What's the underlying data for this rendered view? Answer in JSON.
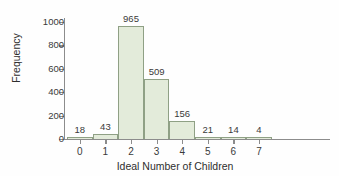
{
  "chart_data": {
    "type": "bar",
    "title": "",
    "subtitle": "",
    "xlabel": "Ideal Number of Children",
    "ylabel": "Frequency",
    "categories": [
      "0",
      "1",
      "2",
      "3",
      "4",
      "5",
      "6",
      "7"
    ],
    "values": [
      18,
      43,
      965,
      509,
      156,
      21,
      14,
      4
    ],
    "data_labels": [
      "18",
      "43",
      "965",
      "509",
      "156",
      "21",
      "14",
      "4"
    ],
    "xlim": [
      -0.5,
      7.5
    ],
    "ylim": [
      0,
      1000
    ],
    "ytick_labels": [
      "0",
      "200",
      "400",
      "600",
      "800",
      "1000"
    ],
    "ytick_values": [
      0,
      200,
      400,
      600,
      800,
      1000
    ],
    "xtick_labels": [
      "0",
      "1",
      "2",
      "3",
      "4",
      "5",
      "6",
      "7"
    ],
    "grid": false,
    "legend": false,
    "legend_position": "none",
    "bar_fill_color": "#e3ebda",
    "bar_edge_color": "#8fa085",
    "axis_color": "#8c8c8c",
    "text_color": "#3a3a3a",
    "background_color": "#fefefe"
  }
}
